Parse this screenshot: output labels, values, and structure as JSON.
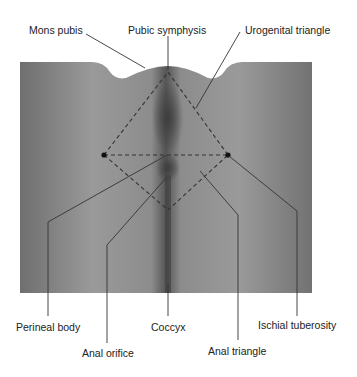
{
  "figure": {
    "labels": {
      "mons_pubis": "Mons pubis",
      "pubic_symphysis": "Pubic symphysis",
      "urogenital_triangle": "Urogenital triangle",
      "perineal_body": "Perineal body",
      "coccyx": "Coccyx",
      "ischial_tuberosity": "Ischial tuberosity",
      "anal_orifice": "Anal orifice",
      "anal_triangle": "Anal triangle"
    },
    "colors": {
      "line": "#333333",
      "dashed_line": "#333333",
      "marker": "#111111",
      "photo_base": "#8a8a8a"
    }
  }
}
